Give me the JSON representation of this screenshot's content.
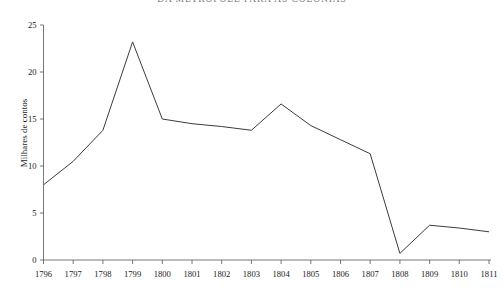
{
  "chart_data": {
    "type": "line",
    "title": "DA METRÓPOLE PARA AS COLÓNIAS",
    "subtitle": "",
    "xlabel": "",
    "ylabel": "Milhares de contos",
    "x": [
      1796,
      1797,
      1798,
      1799,
      1800,
      1801,
      1802,
      1803,
      1804,
      1805,
      1806,
      1807,
      1808,
      1809,
      1810,
      1811
    ],
    "categories": [
      "1796",
      "1797",
      "1798",
      "1799",
      "1800",
      "1801",
      "1802",
      "1803",
      "1804",
      "1805",
      "1806",
      "1807",
      "1808",
      "1809",
      "1810",
      "1811"
    ],
    "series": [
      {
        "name": "Da metrópole para as colónias",
        "values": [
          8.0,
          10.5,
          13.8,
          23.2,
          15.0,
          14.5,
          14.2,
          13.8,
          16.6,
          14.3,
          12.8,
          11.3,
          0.7,
          3.7,
          3.4,
          3.0
        ],
        "color": "#3c3c3c"
      }
    ],
    "ylim": [
      0,
      25
    ],
    "yticks": [
      0,
      5,
      10,
      15,
      20,
      25
    ],
    "ytick_labels": [
      "0",
      "5",
      "10",
      "15",
      "20",
      "25"
    ],
    "xlim": [
      1796,
      1811
    ],
    "xticks": [
      1796,
      1797,
      1798,
      1799,
      1800,
      1801,
      1802,
      1803,
      1804,
      1805,
      1806,
      1807,
      1808,
      1809,
      1810,
      1811
    ],
    "grid": false,
    "legend": false,
    "legend_position": "none",
    "background": "#ffffff",
    "axis_color": "#555555"
  }
}
